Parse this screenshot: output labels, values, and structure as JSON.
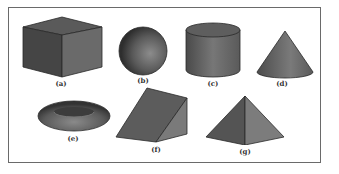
{
  "figure": {
    "shapes": [
      {
        "id": "a",
        "name": "cube",
        "label": "(a)"
      },
      {
        "id": "b",
        "name": "sphere",
        "label": "(b)"
      },
      {
        "id": "c",
        "name": "cylinder",
        "label": "(c)"
      },
      {
        "id": "d",
        "name": "cone",
        "label": "(d)"
      },
      {
        "id": "e",
        "name": "torus",
        "label": "(e)"
      },
      {
        "id": "f",
        "name": "wedge",
        "label": "(f)"
      },
      {
        "id": "g",
        "name": "pyramid",
        "label": "(g)"
      }
    ],
    "colors": {
      "dark_face": "#4a4a4a",
      "mid_face": "#6e6e6e",
      "light_face": "#8a8a8a",
      "frame": "#6a6a6a"
    }
  }
}
